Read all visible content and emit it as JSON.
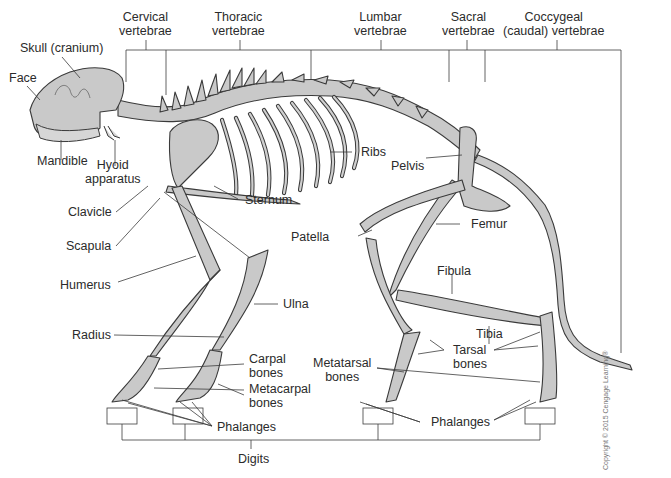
{
  "figure": {
    "colors": {
      "bone_fill": "#c9c9c9",
      "outline": "#3a3a3a",
      "label_text": "#2b2b2b",
      "background": "#ffffff"
    },
    "vertebrae_labels": {
      "cervical": [
        "Cervical",
        "vertebrae"
      ],
      "thoracic": [
        "Thoracic",
        "vertebrae"
      ],
      "lumbar": [
        "Lumbar",
        "vertebrae"
      ],
      "sacral": [
        "Sacral",
        "vertebrae"
      ],
      "coccygeal": [
        "Coccygeal",
        "(caudal) vertebrae"
      ]
    },
    "head_labels": {
      "skull": "Skull (cranium)",
      "face": "Face",
      "mandible": "Mandible",
      "hyoid": [
        "Hyoid",
        "apparatus"
      ]
    },
    "forelimb_labels": {
      "clavicle": "Clavicle",
      "scapula": "Scapula",
      "humerus": "Humerus",
      "radius": "Radius",
      "ulna": "Ulna",
      "carpal": [
        "Carpal",
        "bones"
      ],
      "metacarpal": [
        "Metacarpal",
        "bones"
      ],
      "phalanges": "Phalanges"
    },
    "trunk_labels": {
      "sternum": "Sternum",
      "ribs": "Ribs",
      "pelvis": "Pelvis"
    },
    "hindlimb_labels": {
      "patella": "Patella",
      "femur": "Femur",
      "fibula": "Fibula",
      "tibia": "Tibia",
      "tarsal": [
        "Tarsal",
        "bones"
      ],
      "metatarsal": [
        "Metatarsal",
        "bones"
      ],
      "phalanges": "Phalanges"
    },
    "digits_label": "Digits",
    "copyright": "Copyright © 2015 Cengage Learning®"
  }
}
